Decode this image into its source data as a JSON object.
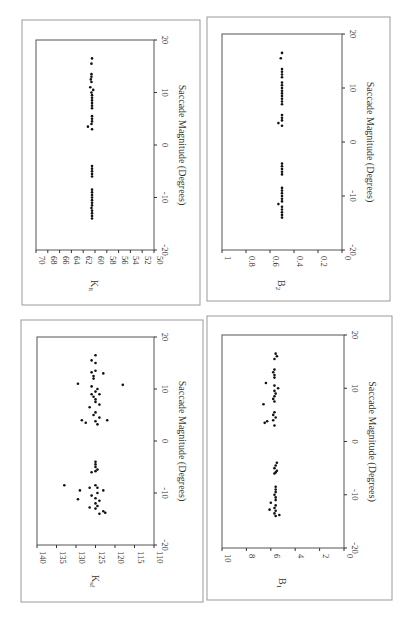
{
  "figure": {
    "rotation_deg": 90,
    "panels": [
      {
        "id": "k_lt",
        "ylabel": "K",
        "ylabel_sub": "lt",
        "xlabel": "Saccade Magnitude (Degrees)",
        "frame": [
          22,
          20,
          200,
          305
        ],
        "plot": [
          36,
          40,
          154,
          250
        ],
        "yticks": [
          "70",
          "68",
          "66",
          "64",
          "62",
          "60",
          "58",
          "56",
          "54",
          "52",
          "50"
        ],
        "ylim": [
          50,
          70
        ],
        "xticks": [
          "-20",
          "-10",
          "0",
          "10",
          "20"
        ],
        "xlim": [
          -20,
          20
        ]
      },
      {
        "id": "b2",
        "ylabel": "B",
        "ylabel_sub": "2",
        "xlabel": "Saccade Magnitude (Degrees)",
        "frame": [
          207,
          17,
          390,
          301
        ],
        "plot": [
          222,
          34,
          342,
          250
        ],
        "yticks": [
          "1",
          "0.8",
          "0.6",
          "0.4",
          "0.2",
          "0"
        ],
        "ylim": [
          0,
          1
        ],
        "xticks": [
          "-20",
          "-10",
          "0",
          "10",
          "20"
        ],
        "xlim": [
          -20,
          20
        ]
      },
      {
        "id": "k_sf",
        "ylabel": "K",
        "ylabel_sub": "sf",
        "xlabel": "Saccade Magnitude (Degrees)",
        "frame": [
          21,
          320,
          203,
          602
        ],
        "plot": [
          37,
          337,
          154,
          545
        ],
        "yticks": [
          "140",
          "135",
          "130",
          "125",
          "120",
          "115",
          "110"
        ],
        "ylim": [
          110,
          140
        ],
        "xticks": [
          "-20",
          "-10",
          "0",
          "10",
          "20"
        ],
        "xlim": [
          -20,
          20
        ]
      },
      {
        "id": "b1",
        "ylabel": "B",
        "ylabel_sub": "1",
        "xlabel": "Saccade Magnitude (Degrees)",
        "frame": [
          207,
          316,
          392,
          600
        ],
        "plot": [
          222,
          335,
          344,
          548
        ],
        "yticks": [
          "10",
          "8",
          "6",
          "4",
          "2",
          "0"
        ],
        "ylim": [
          0,
          10
        ],
        "xticks": [
          "-20",
          "-10",
          "0",
          "10",
          "20"
        ],
        "xlim": [
          -20,
          20
        ]
      }
    ]
  },
  "chart_data": [
    {
      "type": "scatter",
      "title": "",
      "xlabel": "Saccade Magnitude (Degrees)",
      "ylabel": "K_lt",
      "xlim": [
        -20,
        20
      ],
      "ylim": [
        50,
        70
      ],
      "x": [
        -14,
        -13.5,
        -13,
        -12.5,
        -12,
        -11.5,
        -11,
        -10.5,
        -10,
        -9.5,
        -9,
        -8.5,
        -6,
        -5.5,
        -5,
        -4.5,
        -4,
        3,
        3.5,
        4,
        4.5,
        5,
        5.5,
        7,
        7.5,
        8,
        8.5,
        9,
        9.5,
        10,
        10.5,
        11,
        12,
        12.5,
        13,
        13.5,
        15.5,
        16.5
      ],
      "y": [
        60.5,
        60.5,
        60.5,
        60.5,
        60.6,
        60.5,
        60.5,
        60.5,
        60.5,
        60.5,
        60.5,
        60.5,
        60.5,
        60.5,
        60.5,
        60.5,
        60.5,
        60.5,
        61.2,
        60.6,
        60.5,
        60.5,
        60.5,
        60.5,
        60.5,
        60.5,
        60.5,
        60.5,
        60.5,
        60.6,
        60.3,
        60.8,
        60.6,
        60.7,
        60.6,
        60.6,
        60.6,
        60.5
      ]
    },
    {
      "type": "scatter",
      "title": "",
      "xlabel": "Saccade Magnitude (Degrees)",
      "ylabel": "B_2",
      "xlim": [
        -20,
        20
      ],
      "ylim": [
        0,
        1
      ],
      "x": [
        -14,
        -13.5,
        -13,
        -12.5,
        -12,
        -11.5,
        -11,
        -10.5,
        -10,
        -9.5,
        -9,
        -8.5,
        -6,
        -5.5,
        -5,
        -4.5,
        -4,
        3,
        3.5,
        4,
        4.5,
        5,
        7,
        7.5,
        8,
        8.5,
        9,
        9.5,
        10,
        10.5,
        11,
        12,
        12.5,
        13,
        13.5,
        15.5,
        16.5
      ],
      "y": [
        0.5,
        0.5,
        0.5,
        0.5,
        0.5,
        0.53,
        0.5,
        0.5,
        0.5,
        0.5,
        0.5,
        0.5,
        0.5,
        0.5,
        0.5,
        0.5,
        0.5,
        0.5,
        0.53,
        0.5,
        0.5,
        0.5,
        0.5,
        0.5,
        0.5,
        0.5,
        0.5,
        0.5,
        0.5,
        0.5,
        0.5,
        0.5,
        0.5,
        0.5,
        0.5,
        0.51,
        0.5
      ]
    },
    {
      "type": "scatter",
      "title": "",
      "xlabel": "Saccade Magnitude (Degrees)",
      "ylabel": "K_sf",
      "xlim": [
        -20,
        20
      ],
      "ylim": [
        110,
        140
      ],
      "x": [
        -14,
        -13.8,
        -13.5,
        -13,
        -12.8,
        -12.5,
        -12,
        -11.5,
        -11.2,
        -11,
        -10.5,
        -10,
        -9.5,
        -9.5,
        -9,
        -9,
        -8.5,
        -8.5,
        -6,
        -5.8,
        -5.5,
        -5,
        -4.5,
        -4,
        3.2,
        3.5,
        3.8,
        4,
        4,
        4.5,
        5,
        5.5,
        6.5,
        7,
        7.5,
        8,
        8.5,
        9,
        9,
        9.5,
        10,
        10.5,
        10.8,
        11,
        12,
        12.5,
        13,
        13.2,
        13.5,
        15,
        15.5,
        16.5
      ],
      "y": [
        124,
        122.5,
        123,
        125,
        126.5,
        124.5,
        125,
        124,
        129.5,
        125,
        126,
        124.5,
        123,
        129,
        124.5,
        126.5,
        133,
        125,
        126,
        125,
        124.5,
        125,
        125,
        125,
        124.5,
        127.5,
        125,
        128.5,
        122,
        124,
        125.5,
        125,
        126.5,
        124,
        125,
        125,
        125.5,
        124,
        126,
        125,
        124.5,
        126,
        118,
        129.5,
        125.5,
        125.5,
        123,
        126,
        125,
        125,
        126,
        125
      ]
    },
    {
      "type": "scatter",
      "title": "",
      "xlabel": "Saccade Magnitude (Degrees)",
      "ylabel": "B_1",
      "xlim": [
        -20,
        20
      ],
      "ylim": [
        0,
        10
      ],
      "x": [
        -14,
        -13.8,
        -13.5,
        -13,
        -12.8,
        -12.5,
        -12,
        -11.5,
        -11,
        -10.5,
        -10,
        -9.5,
        -9,
        -8.5,
        -6,
        -5.8,
        -5.5,
        -5,
        -4.5,
        -4,
        3,
        3.5,
        3.8,
        4,
        4.5,
        5,
        5.5,
        7,
        7.5,
        8,
        8.5,
        9,
        9.5,
        10,
        10.5,
        11,
        12,
        12.5,
        13,
        13.5,
        15.5,
        16,
        16.5
      ],
      "y": [
        5.6,
        5.3,
        5.7,
        5.6,
        6.1,
        5.7,
        5.6,
        6,
        5.6,
        5.6,
        5.7,
        5.6,
        5.6,
        5.6,
        5.7,
        5.6,
        5.5,
        5.7,
        5.6,
        5.5,
        5.7,
        6.5,
        6.3,
        5.8,
        5.6,
        5.8,
        5.7,
        6.6,
        5.7,
        5.8,
        5.7,
        5.6,
        5.7,
        5.4,
        5.7,
        6.4,
        5.7,
        5.7,
        5.8,
        5.7,
        5.7,
        5.5,
        5.6
      ]
    }
  ]
}
